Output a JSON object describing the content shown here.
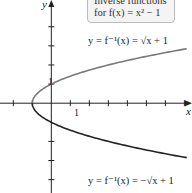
{
  "chart_data": {
    "type": "line",
    "title": "Inverse functions for f(x) = x² − 1",
    "title_line1": "Inverse functions",
    "title_line2": "for f(x) = x² − 1",
    "xlabel": "x",
    "ylabel": "y",
    "xlim": [
      -2.7,
      7.4
    ],
    "ylim": [
      -4.7,
      5.4
    ],
    "x_tick_labels": [
      {
        "value": 1,
        "label": "1"
      }
    ],
    "y_tick_labels": [
      {
        "value": 1,
        "label": "1"
      }
    ],
    "x_ticks": [
      -2,
      -1,
      1,
      2,
      3,
      4,
      5,
      6,
      7
    ],
    "y_ticks": [
      -4,
      -3,
      -2,
      1,
      2,
      3,
      4
    ],
    "series": [
      {
        "name": "y = f⁻¹(x) = √(x + 1)",
        "label": "y = f⁻¹(x) = √x + 1",
        "color": "#7a7a7a",
        "x": [
          -1,
          -0.75,
          0,
          1,
          2,
          3,
          4,
          5,
          6,
          7
        ],
        "y": [
          0,
          0.5,
          1,
          1.414,
          1.732,
          2,
          2.236,
          2.449,
          2.646,
          2.828
        ]
      },
      {
        "name": "y = f⁻¹(x) = −√(x + 1)",
        "label": "y = f⁻¹(x) = −√x + 1",
        "color": "#222222",
        "x": [
          -1,
          -0.75,
          0,
          1,
          2,
          3,
          4,
          5,
          6,
          7
        ],
        "y": [
          0,
          -0.5,
          -1,
          -1.414,
          -1.732,
          -2,
          -2.236,
          -2.449,
          -2.646,
          -2.828
        ]
      }
    ],
    "grid": false,
    "legend": "annotations"
  }
}
